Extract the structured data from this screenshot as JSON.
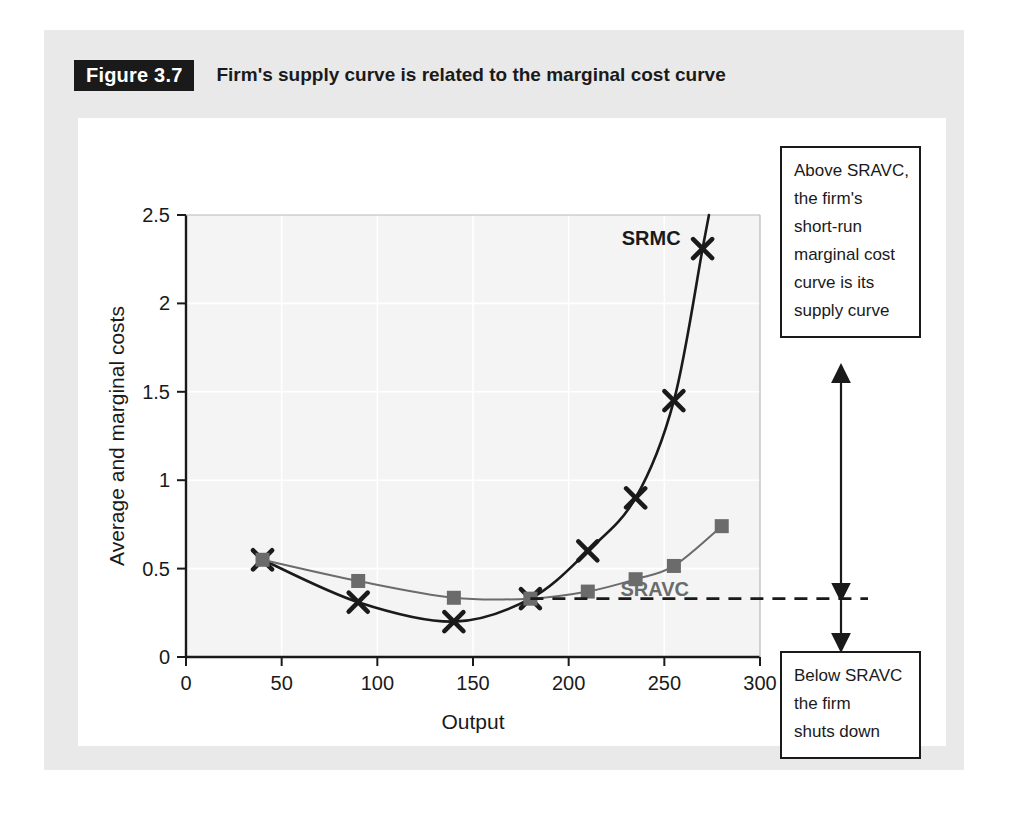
{
  "figure": {
    "badge": "Figure 3.7",
    "title": "Firm's supply curve is related to the marginal cost curve"
  },
  "colors": {
    "srmc": "#1a1a1a",
    "sravc": "#6b6b6b",
    "plot_background": "#f4f4f4",
    "gridline": "#ffffff",
    "axis": "#1a1a1a",
    "callout_border": "#1a1a1a",
    "mat": "#e9e9e9",
    "panel": "#ffffff"
  },
  "chart_data": {
    "type": "line",
    "title": "Firm's supply curve is related to the marginal cost curve",
    "xlabel": "Output",
    "ylabel": "Average and marginal costs",
    "xlim": [
      0,
      300
    ],
    "ylim": [
      0,
      2.5
    ],
    "xticks": [
      0,
      50,
      100,
      150,
      200,
      250,
      300
    ],
    "xtick_labels": [
      "0",
      "50",
      "100",
      "150",
      "200",
      "250",
      "300"
    ],
    "yticks": [
      0,
      0.5,
      1,
      1.5,
      2,
      2.5
    ],
    "ytick_labels": [
      "0",
      "0.5",
      "1",
      "1.5",
      "2",
      "2.5"
    ],
    "grid": true,
    "legend_position": "inline-labels",
    "series": [
      {
        "name": "SRMC",
        "label": "SRMC",
        "marker": "x",
        "color": "#1a1a1a",
        "x": [
          40,
          90,
          140,
          180,
          210,
          235,
          255,
          270
        ],
        "values": [
          0.55,
          0.31,
          0.2,
          0.33,
          0.6,
          0.9,
          1.45,
          2.31
        ]
      },
      {
        "name": "SRAVC",
        "label": "SRAVC",
        "marker": "square",
        "color": "#6b6b6b",
        "x": [
          40,
          90,
          140,
          180,
          210,
          235,
          255,
          280
        ],
        "values": [
          0.55,
          0.43,
          0.335,
          0.33,
          0.37,
          0.44,
          0.515,
          0.74
        ]
      }
    ],
    "annotations": {
      "shutdown_price_line": {
        "type": "horizontal-dashed",
        "y": 0.33,
        "x_start": 180,
        "x_end": 300
      },
      "callout_above": {
        "text": "Above SRAVC, the firm's short-run marginal cost curve is its supply curve",
        "lines": [
          "Above SRAVC,",
          "the firm's",
          "short-run",
          "marginal cost",
          "curve is its",
          "supply curve"
        ]
      },
      "callout_below": {
        "text": "Below SRAVC the firm shuts down",
        "lines": [
          "Below SRAVC",
          "the firm",
          "shuts down"
        ]
      }
    }
  }
}
